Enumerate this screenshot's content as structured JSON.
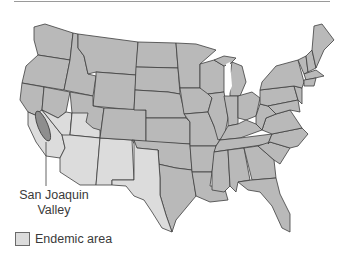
{
  "map": {
    "subject": "Contiguous United States",
    "colors": {
      "state_fill": "#b9b9b9",
      "endemic_fill": "#dcdcdc",
      "valley_fill": "#8e8e8e",
      "border": "#3d3d3d",
      "water": "#ffffff"
    },
    "callout": {
      "label_line1": "San Joaquin",
      "label_line2": "Valley"
    },
    "legend": {
      "items": [
        {
          "label": "Endemic area",
          "swatch_color": "#dcdcdc"
        }
      ]
    }
  }
}
